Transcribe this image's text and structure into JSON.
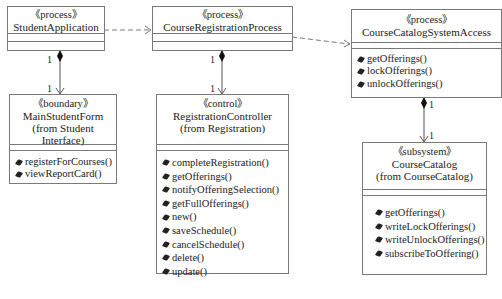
{
  "classes": {
    "student_application": {
      "stereotype": "《process》",
      "name": "StudentApplication"
    },
    "course_registration_process": {
      "stereotype": "《process》",
      "name": "CourseRegistrationProcess"
    },
    "course_catalog_system_access": {
      "stereotype": "《process》",
      "name": "CourseCatalogSystemAccess",
      "operations": [
        "getOfferings()",
        "lockOfferings()",
        "unlockOfferings()"
      ]
    },
    "main_student_form": {
      "stereotype": "《boundary》",
      "name": "MainStudentForm",
      "package": "(from Student Interface)",
      "operations": [
        "registerForCourses()",
        "viewReportCard()"
      ]
    },
    "registration_controller": {
      "stereotype": "《control》",
      "name": "RegistrationController",
      "package": "(from Registration)",
      "operations": [
        "completeRegistration()",
        "getOfferings()",
        "notifyOfferingSelection()",
        "getFullOfferings()",
        "new()",
        "saveSchedule()",
        "cancelSchedule()",
        "delete()",
        "update()"
      ]
    },
    "course_catalog": {
      "stereotype": "《subsystem》",
      "name": "CourseCatalog",
      "package": "(from CourseCatalog)",
      "operations": [
        "getOfferings()",
        "writeLockOfferings()",
        "writeUnlockOfferings()",
        "subscribeToOffering()"
      ]
    }
  },
  "multiplicities": {
    "sa_whole": "1",
    "sa_part": "1",
    "crp_whole": "1",
    "crp_part": "1",
    "ccsa_whole": "1",
    "ccsa_part": "1"
  },
  "colors": {
    "line": "#7a7a7a",
    "text": "#222222"
  }
}
